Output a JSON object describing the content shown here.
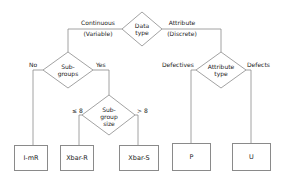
{
  "diagram": {
    "root": {
      "line1": "Data",
      "line2": "type"
    },
    "branches": {
      "continuous": {
        "line1": "Continuous",
        "line2": "(Variable)"
      },
      "attribute": {
        "line1": "Attribute",
        "line2": "(Discrete)"
      }
    },
    "subgroups": {
      "line1": "Sub-",
      "line2": "groups",
      "no": "No",
      "yes": "Yes"
    },
    "subgroup_size": {
      "line1": "Sub-",
      "line2": "group",
      "line3": "size",
      "le": "≤ 8",
      "gt": "> 8"
    },
    "attribute_type": {
      "line1": "Attribute",
      "line2": "type",
      "left": "Defectives",
      "right": "Defects"
    },
    "charts": [
      {
        "id": "imr",
        "label": "I-mR"
      },
      {
        "id": "xbar-r",
        "label": "Xbar-R"
      },
      {
        "id": "xbar-s",
        "label": "Xbar-S"
      },
      {
        "id": "p",
        "label": "P"
      },
      {
        "id": "u",
        "label": "U"
      }
    ],
    "colors": {
      "line": "#8a8a8a",
      "text": "#222222"
    }
  }
}
